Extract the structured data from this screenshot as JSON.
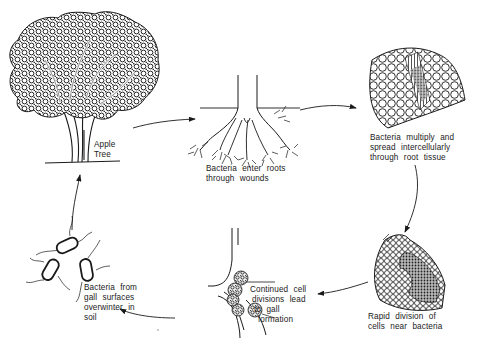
{
  "diagram": {
    "type": "disease-cycle",
    "stages": [
      {
        "id": "apple-tree",
        "lines": [
          "Apple",
          "Tree"
        ]
      },
      {
        "id": "enter-roots",
        "lines": [
          "Bacteria enter roots",
          "through wounds"
        ]
      },
      {
        "id": "multiply-spread",
        "lines": [
          "Bacteria multiply and",
          "spread intercellularly",
          "through root tissue"
        ]
      },
      {
        "id": "rapid-division",
        "lines": [
          "Rapid division of",
          "cells near bacteria"
        ]
      },
      {
        "id": "gall-formation",
        "lines": [
          "Continued cell",
          "divisions lead",
          "to gall",
          "formation"
        ]
      },
      {
        "id": "overwinter",
        "lines": [
          "Bacteria from",
          "gall surfaces",
          "overwinter in",
          "soil"
        ]
      }
    ],
    "flow": [
      "apple-tree",
      "enter-roots",
      "multiply-spread",
      "rapid-division",
      "gall-formation",
      "overwinter",
      "apple-tree"
    ],
    "colors": {
      "ink": "#1a1a1a",
      "background": "#ffffff"
    }
  }
}
